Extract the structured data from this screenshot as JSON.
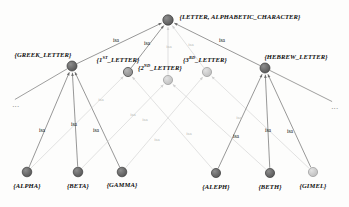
{
  "diagram": {
    "edge_label": "isa",
    "ellipsis": "...",
    "colors": {
      "background": "#fdfdfc",
      "node_dark": "#555555",
      "node_mid": "#8a8a8a",
      "node_light": "#bdbdbd",
      "edge_dark": "#6b6b6b",
      "edge_light": "#cfcfcf",
      "text": "#0d0d0d",
      "text_faint": "#b9b9b9"
    },
    "nodes": [
      {
        "id": "root",
        "label": "{LETTER, ALPHABETIC_CHARACTER}",
        "x": 168,
        "y": 20,
        "r": 5.2,
        "shade": "dark",
        "label_x": 240,
        "label_y": 17
      },
      {
        "id": "greek",
        "label": "{GREEK_LETTER}",
        "x": 72,
        "y": 66,
        "r": 5.0,
        "shade": "dark",
        "label_x": 43,
        "label_y": 55
      },
      {
        "id": "first",
        "label": "{1ST_LETTER}",
        "sup": "ST",
        "base": "{1",
        "tail": "_LETTER}",
        "x": 128,
        "y": 72,
        "r": 4.6,
        "shade": "mid",
        "label_x": 118,
        "label_y": 60
      },
      {
        "id": "second",
        "label": "{2ND_LETTER}",
        "sup": "ND",
        "base": "{2",
        "tail": "_LETTER}",
        "x": 168,
        "y": 80,
        "r": 4.6,
        "shade": "light",
        "label_x": 160,
        "label_y": 68
      },
      {
        "id": "third",
        "label": "{3RD_LETTER}",
        "sup": "RD",
        "base": "{3",
        "tail": "_LETTER}",
        "x": 207,
        "y": 72,
        "r": 4.6,
        "shade": "light",
        "label_x": 205,
        "label_y": 60
      },
      {
        "id": "hebrew",
        "label": "{HEBREW_LETTER}",
        "x": 265,
        "y": 68,
        "r": 5.0,
        "shade": "dark",
        "label_x": 296,
        "label_y": 57
      },
      {
        "id": "alpha",
        "label": "{ALPHA}",
        "x": 27,
        "y": 172,
        "r": 4.8,
        "shade": "dark",
        "label_x": 27,
        "label_y": 186
      },
      {
        "id": "beta",
        "label": "{BETA}",
        "x": 78,
        "y": 172,
        "r": 4.8,
        "shade": "dark",
        "label_x": 78,
        "label_y": 186
      },
      {
        "id": "gamma",
        "label": "{GAMMA}",
        "x": 122,
        "y": 172,
        "r": 4.8,
        "shade": "dark",
        "label_x": 122,
        "label_y": 185
      },
      {
        "id": "aleph",
        "label": "{ALEPH}",
        "x": 216,
        "y": 173,
        "r": 4.6,
        "shade": "dark",
        "label_x": 216,
        "label_y": 187
      },
      {
        "id": "beth",
        "label": "{BETH}",
        "x": 270,
        "y": 173,
        "r": 4.6,
        "shade": "dark",
        "label_x": 270,
        "label_y": 187
      },
      {
        "id": "gimel",
        "label": "{GIMEL}",
        "x": 313,
        "y": 172,
        "r": 4.6,
        "shade": "light",
        "label_x": 313,
        "label_y": 186
      }
    ],
    "edges": [
      {
        "from": "greek",
        "to": "root",
        "tone": "dark",
        "label": "isa",
        "label_x": 116,
        "label_y": 41
      },
      {
        "from": "first",
        "to": "root",
        "tone": "dark",
        "label": "isa",
        "label_x": 147,
        "label_y": 44
      },
      {
        "from": "second",
        "to": "root",
        "tone": "faint",
        "label": "isa",
        "label_x": 169,
        "label_y": 46
      },
      {
        "from": "third",
        "to": "root",
        "tone": "faint",
        "label": "isa",
        "label_x": 191,
        "label_y": 44
      },
      {
        "from": "hebrew",
        "to": "root",
        "tone": "dark",
        "label": "isa",
        "label_x": 222,
        "label_y": 41
      },
      {
        "from": "alpha",
        "to": "greek",
        "tone": "dark",
        "label": "isa",
        "label_x": 42,
        "label_y": 131
      },
      {
        "from": "beta",
        "to": "greek",
        "tone": "dark",
        "label": "isa",
        "label_x": 74,
        "label_y": 125
      },
      {
        "from": "gamma",
        "to": "greek",
        "tone": "dark",
        "label": "isa",
        "label_x": 96,
        "label_y": 131
      },
      {
        "from": "alpha",
        "to": "first",
        "tone": "faint",
        "label": "isa",
        "label_x": 101,
        "label_y": 99
      },
      {
        "from": "beta",
        "to": "second",
        "tone": "faint",
        "label": "isa",
        "label_x": 133,
        "label_y": 114
      },
      {
        "from": "gamma",
        "to": "third",
        "tone": "faint",
        "label": "isa",
        "label_x": 157,
        "label_y": 139
      },
      {
        "from": "aleph",
        "to": "first",
        "tone": "faint",
        "label": "isa",
        "label_x": 145,
        "label_y": 119
      },
      {
        "from": "beth",
        "to": "second",
        "tone": "faint",
        "label": "isa",
        "label_x": 189,
        "label_y": 133
      },
      {
        "from": "gimel",
        "to": "third",
        "tone": "faint",
        "label": "isa",
        "label_x": 239,
        "label_y": 117
      },
      {
        "from": "aleph",
        "to": "hebrew",
        "tone": "dark",
        "label": "isa",
        "label_x": 236,
        "label_y": 137
      },
      {
        "from": "beth",
        "to": "hebrew",
        "tone": "dark",
        "label": "isa",
        "label_x": 268,
        "label_y": 131
      },
      {
        "from": "gimel",
        "to": "hebrew",
        "tone": "dark",
        "label": "isa",
        "label_x": 290,
        "label_y": 132
      }
    ],
    "stub_edges": [
      {
        "from": "greek",
        "x2": 14,
        "y2": 100,
        "tone": "dark"
      },
      {
        "from": "hebrew",
        "x2": 333,
        "y2": 102,
        "tone": "dark"
      }
    ],
    "ellipses": [
      {
        "x": 16,
        "y": 105
      },
      {
        "x": 335,
        "y": 107
      }
    ]
  }
}
